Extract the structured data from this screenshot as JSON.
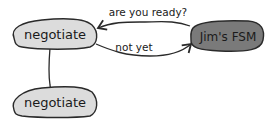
{
  "diagram": {
    "nodes": [
      {
        "id": "negotiate-1",
        "label": "negotiate",
        "fill": "#dcdcdc"
      },
      {
        "id": "jims-fsm",
        "label": "Jim's FSM",
        "fill": "#7a7a7a"
      },
      {
        "id": "negotiate-2",
        "label": "negotiate",
        "fill": "#dcdcdc"
      }
    ],
    "edges": [
      {
        "from": "jims-fsm",
        "to": "negotiate-1",
        "label": "are you ready?"
      },
      {
        "from": "negotiate-1",
        "to": "jims-fsm",
        "label": "not yet"
      },
      {
        "from": "negotiate-1",
        "to": "negotiate-2",
        "label": ""
      }
    ],
    "stroke": "#2a2a2a"
  }
}
